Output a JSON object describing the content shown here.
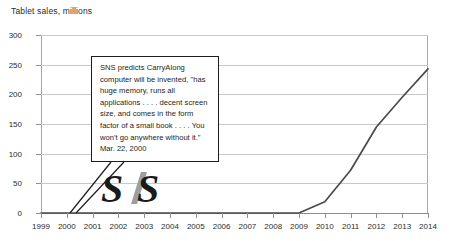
{
  "chart_data": {
    "type": "line",
    "title": "Tablet sales, millions",
    "xlabel": "",
    "ylabel": "",
    "grid": true,
    "legend": "none",
    "xlim": [
      1999,
      2014
    ],
    "ylim": [
      0,
      300
    ],
    "yticks": [
      0,
      50,
      100,
      150,
      200,
      250,
      300
    ],
    "categories": [
      "1999",
      "2000",
      "2001",
      "2002",
      "2003",
      "2004",
      "2005",
      "2006",
      "2007",
      "2008",
      "2009",
      "2010",
      "2011",
      "2012",
      "2013",
      "2014"
    ],
    "x": [
      1999,
      2000,
      2001,
      2002,
      2003,
      2004,
      2005,
      2006,
      2007,
      2008,
      2009,
      2010,
      2011,
      2012,
      2013,
      2014
    ],
    "series": [
      {
        "name": "Tablet sales",
        "values": [
          0,
          0,
          0,
          0,
          0,
          0,
          0,
          0,
          0,
          0,
          0,
          19,
          72,
          145,
          195,
          243
        ],
        "color": "#4a4a4a"
      }
    ],
    "annotations": [
      {
        "name": "sns-prediction-callout",
        "text": "SNS predicts CarryAlong computer will be invented, \"has huge memory, runs all applications . . . . decent screen size, and comes in the form factor of a small book . . . . You won't go anywhere without it.\"",
        "date": "Mar. 22, 2000",
        "anchor_x": 2000,
        "anchor_y": 0
      }
    ],
    "logo": {
      "name": "sns-logo",
      "text": "SNS",
      "dark_color": "#1a1a1a",
      "accent_color": "#9e9e9e"
    },
    "colors": {
      "axis": "#8e8e8e",
      "grid": "#c9c9c9",
      "text": "#2b2b2b",
      "line": "#4a4a4a",
      "callout_border": "#1d1d1d",
      "background": "#ffffff"
    }
  }
}
